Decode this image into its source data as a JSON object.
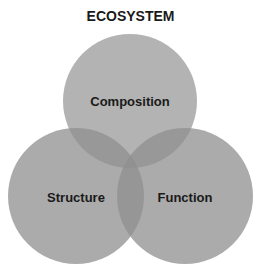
{
  "title": "ECOSYSTEM",
  "circles": [
    {
      "label": "Composition",
      "color": "#a8a8a8"
    },
    {
      "label": "Structure",
      "color": "#a8a8a8"
    },
    {
      "label": "Function",
      "color": "#a8a8a8"
    }
  ]
}
